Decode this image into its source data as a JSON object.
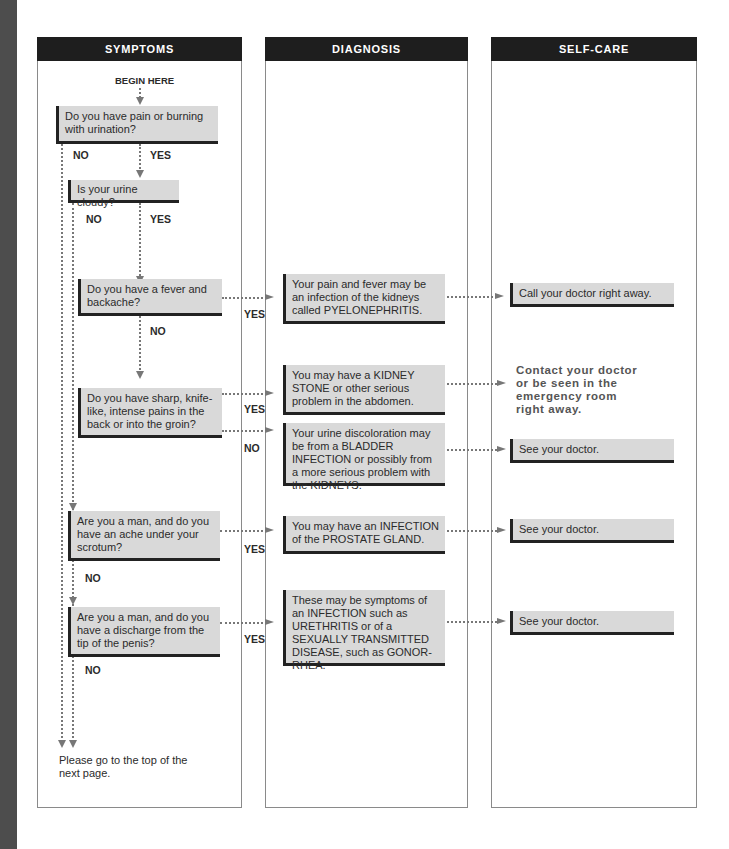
{
  "columns": {
    "symptoms": "SYMPTOMS",
    "diagnosis": "DIAGNOSIS",
    "self_care": "SELF-CARE"
  },
  "start_label": "BEGIN HERE",
  "questions": [
    {
      "text": "Do you have pain or burning with urination?",
      "yes": "YES",
      "no": "NO"
    },
    {
      "text": "Is your urine cloudy?",
      "yes": "YES",
      "no": "NO"
    },
    {
      "text": "Do you have a fever and backache?",
      "yes": "YES",
      "no": "NO"
    },
    {
      "text": "Do you have sharp, knife-like, intense pains in the back or into the groin?",
      "yes": "YES",
      "no": "NO"
    },
    {
      "text": "Are you a man, and do you have an ache under your scrotum?",
      "yes": "YES",
      "no": "NO"
    },
    {
      "text": "Are you a man, and do you have a discharge from the tip of the penis?",
      "yes": "YES",
      "no": "NO"
    }
  ],
  "diagnoses": [
    {
      "text": "Your pain and fever may be an infection of the kidneys called PYELONEPHRITIS."
    },
    {
      "text": "You may have a KIDNEY STONE or other serious problem in the abdomen."
    },
    {
      "text": "Your urine discoloration may be from a BLADDER INFECTION or possibly from a more serious problem with the KIDNEYS."
    },
    {
      "text": "You may have an INFECTION of the PROSTATE GLAND."
    },
    {
      "text": "These may be symptoms of an INFECTION such as URETHRITIS or of a SEXUALLY TRANSMITTED DISEASE, such as GONOR-RHEA."
    }
  ],
  "self_care": [
    {
      "text": "Call your doctor right away."
    },
    {
      "text": "Contact your doctor or be seen in the emergency room right away."
    },
    {
      "text": "See your doctor."
    },
    {
      "text": "See your doctor."
    },
    {
      "text": "See your doctor."
    }
  ],
  "end_note": "Please go to the top of the next page.",
  "colors": {
    "header_bg": "#1e1e1e",
    "box_bg": "#d9d9d9",
    "strip": "#4d4d4d"
  }
}
